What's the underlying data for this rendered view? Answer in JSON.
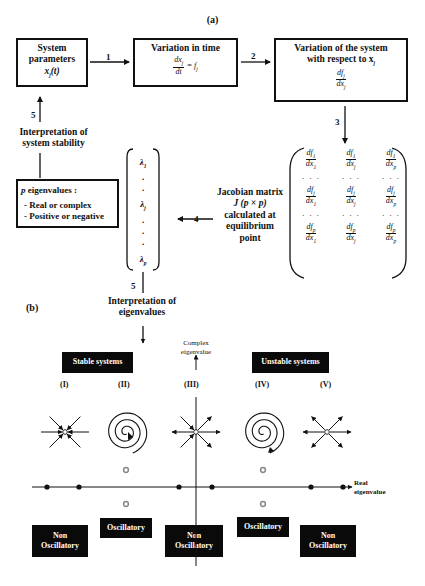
{
  "panel_a": {
    "label": "(a)",
    "box_system_parameters": {
      "line1": "System",
      "line2": "parameters",
      "var": "x",
      "sub": "j",
      "arg": "(t)"
    },
    "box_variation_time": {
      "title": "Variation in time",
      "num": "dx",
      "num_sub": "j",
      "den": "dt",
      "rhs": "= f",
      "rhs_sub": "j"
    },
    "box_variation_system": {
      "line1": "Variation of the system",
      "line2": "with respect to x",
      "line2_sub": "j",
      "num": "df",
      "num_sub": "j",
      "den": "dx",
      "den_sub": "j"
    },
    "steps": {
      "s1": "1",
      "s2": "2",
      "s3": "3",
      "s4": "4",
      "s5a": "5",
      "s5b": "5"
    },
    "jacobian_label": {
      "l1": "Jacobian matrix",
      "l2": "J (p × p)",
      "l3": "calculated at",
      "l4": "equilibrium",
      "l5": "point"
    },
    "jacobian_matrix": {
      "rows": [
        [
          {
            "n": "df",
            "ns": "1",
            "d": "dx",
            "ds": "1"
          },
          {
            "n": "df",
            "ns": "1",
            "d": "dx",
            "ds": "j"
          },
          {
            "n": "df",
            "ns": "1",
            "d": "dx",
            "ds": "p"
          }
        ],
        "dots",
        [
          {
            "n": "df",
            "ns": "j",
            "d": "dx",
            "ds": "1"
          },
          {
            "n": "df",
            "ns": "j",
            "d": "dx",
            "ds": "j"
          },
          {
            "n": "df",
            "ns": "j",
            "d": "dx",
            "ds": "p"
          }
        ],
        "dots",
        [
          {
            "n": "df",
            "ns": "p",
            "d": "dx",
            "ds": "1"
          },
          {
            "n": "df",
            "ns": "p",
            "d": "dx",
            "ds": "j"
          },
          {
            "n": "df",
            "ns": "p",
            "d": "dx",
            "ds": "p"
          }
        ]
      ],
      "ellipsis": "· · ·"
    },
    "eigen_vector": {
      "l1": "λ",
      "s1": "1",
      "lj": "λ",
      "sj": "j",
      "lp": "λ",
      "sp": "p",
      "dot": "."
    },
    "eigen_box": {
      "title_var": "p",
      "title": " eigenvalues :",
      "item1": "- Real or complex",
      "item2": "- Positive or negative"
    },
    "interp_stability": {
      "l1": "Interpretation of",
      "l2": "system stability"
    },
    "interp_eigen": {
      "l1": "Interpretation of",
      "l2": "eigenvalues"
    }
  },
  "panel_b": {
    "label": "(b)",
    "stable_label": "Stable systems",
    "unstable_label": "Unstable systems",
    "y_axis_label": {
      "l1": "Complex",
      "l2": "eigenvalue"
    },
    "x_axis_label": {
      "l1": "Real",
      "l2": "eigenvalue"
    },
    "cases": [
      {
        "id": "(I)",
        "portrait": "stable-node",
        "class": "Non Oscillatory"
      },
      {
        "id": "(II)",
        "portrait": "stable-spiral",
        "class": "Oscillatory"
      },
      {
        "id": "(III)",
        "portrait": "saddle",
        "class": "Non Oscillatory"
      },
      {
        "id": "(IV)",
        "portrait": "unstable-spiral",
        "class": "Oscillatory"
      },
      {
        "id": "(V)",
        "portrait": "unstable-node",
        "class": "Non Oscillatory"
      }
    ],
    "class_labels": {
      "non1": "Non",
      "non2": "Oscillatory",
      "osc": "Oscillatory"
    },
    "colors": {
      "ink": "#111111",
      "label_bg": "#0a0a0a",
      "label_text": "#ffffff",
      "complex_dot": "#888888"
    }
  }
}
